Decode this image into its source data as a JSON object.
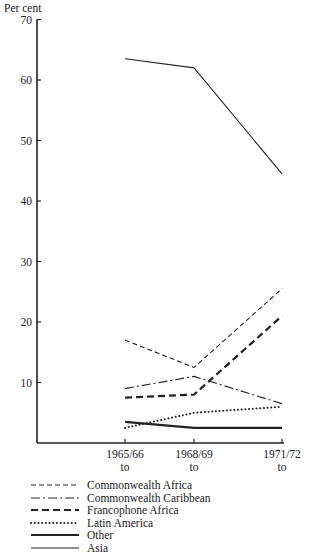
{
  "chart_data": {
    "type": "line",
    "title": "",
    "ylabel": "Per cent",
    "xlabel": "",
    "ylim": [
      0,
      70
    ],
    "yticks": [
      10,
      20,
      30,
      40,
      50,
      60,
      70
    ],
    "grid": false,
    "legend_position": "bottom-left",
    "categories": [
      "1965/66 to 1967/68",
      "1968/69 to 1970/71",
      "1971/72 to 1973/74"
    ],
    "category_lines": [
      [
        "1965/66",
        "to",
        "1967/68"
      ],
      [
        "1968/69",
        "to",
        "1970/71"
      ],
      [
        "1971/72",
        "to",
        "1973/74"
      ]
    ],
    "series": [
      {
        "name": "Commonwealth Africa",
        "style": "dashed-thin",
        "values": [
          17,
          12.5,
          25.5
        ]
      },
      {
        "name": "Commonwealth Caribbean",
        "style": "dash-dot",
        "values": [
          9,
          11,
          6.5
        ]
      },
      {
        "name": "Francophone Africa",
        "style": "dashed-thick",
        "values": [
          7.5,
          8,
          21
        ]
      },
      {
        "name": "Latin America",
        "style": "dotted",
        "values": [
          2.5,
          5,
          6
        ]
      },
      {
        "name": "Other",
        "style": "solid-thick",
        "values": [
          3.5,
          2.5,
          2.5
        ]
      },
      {
        "name": "Asia",
        "style": "solid-thin",
        "values": [
          63.5,
          62,
          44.5
        ]
      }
    ]
  }
}
